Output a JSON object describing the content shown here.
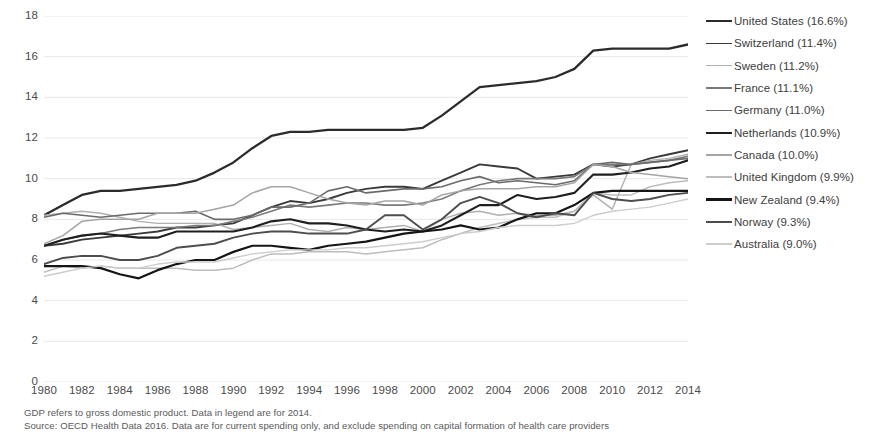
{
  "chart_data": {
    "type": "line",
    "title": "",
    "subtitle": "",
    "xlabel": "",
    "ylabel": "",
    "xlim": [
      1980,
      2014
    ],
    "ylim": [
      0,
      18
    ],
    "ytick_step": 2,
    "grid": "horizontal",
    "legend_position": "right",
    "yticks": [
      "18",
      "16",
      "14",
      "12",
      "10",
      "8",
      "6",
      "4",
      "2",
      "0"
    ],
    "xticks": [
      "1980",
      "1982",
      "1984",
      "1986",
      "1988",
      "1990",
      "1992",
      "1994",
      "1996",
      "1998",
      "2000",
      "2002",
      "2004",
      "2006",
      "2008",
      "2010",
      "2012",
      "2014"
    ],
    "x": [
      1980,
      1981,
      1982,
      1983,
      1984,
      1985,
      1986,
      1987,
      1988,
      1989,
      1990,
      1991,
      1992,
      1993,
      1994,
      1995,
      1996,
      1997,
      1998,
      1999,
      2000,
      2001,
      2002,
      2003,
      2004,
      2005,
      2006,
      2007,
      2008,
      2009,
      2010,
      2011,
      2012,
      2013,
      2014
    ],
    "series": [
      {
        "name": "United States",
        "legend_label": "United States (16.6%)",
        "value_2014": 16.6,
        "color": "#2b2b2b",
        "width": 2.3,
        "values": [
          8.2,
          8.7,
          9.2,
          9.4,
          9.4,
          9.5,
          9.6,
          9.7,
          9.9,
          10.3,
          10.8,
          11.5,
          12.1,
          12.3,
          12.3,
          12.4,
          12.4,
          12.4,
          12.4,
          12.4,
          12.5,
          13.1,
          13.8,
          14.5,
          14.6,
          14.7,
          14.8,
          15.0,
          15.4,
          16.3,
          16.4,
          16.4,
          16.4,
          16.4,
          16.6
        ]
      },
      {
        "name": "Switzerland",
        "legend_label": "Switzerland (11.4%)",
        "value_2014": 11.4,
        "color": "#3a3a3a",
        "width": 1.9,
        "values": [
          6.7,
          6.8,
          7.0,
          7.1,
          7.2,
          7.3,
          7.4,
          7.6,
          7.6,
          7.7,
          7.8,
          8.2,
          8.6,
          8.9,
          8.8,
          9.0,
          9.3,
          9.5,
          9.6,
          9.6,
          9.5,
          9.9,
          10.3,
          10.7,
          10.6,
          10.5,
          10.0,
          10.1,
          10.2,
          10.7,
          10.6,
          10.7,
          11.0,
          11.2,
          11.4
        ]
      },
      {
        "name": "Sweden",
        "legend_label": "Sweden (11.2%)",
        "value_2014": 11.2,
        "color": "#b0b0b0",
        "width": 1.4,
        "values": [
          8.2,
          8.3,
          8.4,
          8.3,
          8.1,
          7.9,
          7.8,
          7.8,
          7.8,
          7.8,
          7.5,
          7.6,
          7.7,
          7.8,
          7.5,
          7.4,
          7.6,
          7.5,
          7.6,
          7.7,
          7.4,
          8.0,
          8.3,
          8.4,
          8.2,
          8.3,
          8.2,
          8.2,
          8.4,
          9.2,
          8.5,
          10.7,
          10.9,
          11.0,
          11.2
        ]
      },
      {
        "name": "France",
        "legend_label": "France (11.1%)",
        "value_2014": 11.1,
        "color": "#7a7a7a",
        "width": 1.6,
        "values": [
          6.7,
          7.0,
          7.2,
          7.3,
          7.5,
          7.6,
          7.6,
          7.6,
          7.7,
          7.7,
          7.9,
          8.1,
          8.4,
          8.7,
          8.6,
          8.7,
          8.8,
          8.8,
          8.7,
          8.7,
          8.8,
          9.0,
          9.4,
          9.7,
          9.9,
          10.0,
          10.0,
          10.0,
          10.1,
          10.7,
          10.7,
          10.7,
          10.8,
          10.9,
          11.1
        ]
      },
      {
        "name": "Germany",
        "legend_label": "Germany (11.0%)",
        "value_2014": 11.0,
        "color": "#6b6b6b",
        "width": 1.6,
        "values": [
          8.1,
          8.3,
          8.2,
          8.1,
          8.2,
          8.3,
          8.3,
          8.3,
          8.4,
          8.0,
          8.0,
          8.2,
          8.6,
          8.6,
          8.8,
          9.4,
          9.6,
          9.3,
          9.4,
          9.5,
          9.5,
          9.6,
          9.9,
          10.1,
          9.8,
          9.9,
          9.8,
          9.7,
          9.9,
          10.7,
          10.8,
          10.7,
          10.8,
          10.9,
          11.0
        ]
      },
      {
        "name": "Netherlands",
        "legend_label": "Netherlands (10.9%)",
        "value_2014": 10.9,
        "color": "#1f1f1f",
        "width": 2.1,
        "values": [
          6.7,
          7.0,
          7.2,
          7.3,
          7.2,
          7.1,
          7.1,
          7.4,
          7.4,
          7.4,
          7.4,
          7.6,
          7.9,
          8.0,
          7.8,
          7.8,
          7.7,
          7.5,
          7.4,
          7.5,
          7.4,
          7.7,
          8.2,
          8.7,
          8.7,
          9.2,
          9.0,
          9.1,
          9.3,
          10.2,
          10.2,
          10.3,
          10.5,
          10.6,
          10.9
        ]
      },
      {
        "name": "Canada",
        "legend_label": "Canada (10.0%)",
        "value_2014": 10.0,
        "color": "#a5a5a5",
        "width": 1.5,
        "values": [
          6.8,
          7.2,
          7.9,
          8.0,
          8.0,
          8.0,
          8.3,
          8.3,
          8.3,
          8.5,
          8.7,
          9.3,
          9.6,
          9.6,
          9.3,
          9.0,
          8.8,
          8.7,
          8.9,
          8.9,
          8.7,
          9.2,
          9.4,
          9.5,
          9.5,
          9.5,
          9.6,
          9.6,
          9.8,
          10.7,
          10.6,
          10.3,
          10.2,
          10.1,
          10.0
        ]
      },
      {
        "name": "United Kingdom",
        "legend_label": "United Kingdom (9.9%)",
        "value_2014": 9.9,
        "color": "#bdbdbd",
        "width": 1.5,
        "values": [
          5.4,
          5.7,
          5.6,
          5.7,
          5.6,
          5.6,
          5.6,
          5.6,
          5.5,
          5.5,
          5.6,
          6.0,
          6.3,
          6.3,
          6.4,
          6.4,
          6.4,
          6.3,
          6.4,
          6.5,
          6.6,
          7.0,
          7.3,
          7.6,
          7.8,
          8.0,
          8.1,
          8.1,
          8.4,
          9.3,
          9.2,
          9.2,
          9.6,
          9.8,
          9.9
        ]
      },
      {
        "name": "New Zealand",
        "legend_label": "New Zealand (9.4%)",
        "value_2014": 9.4,
        "color": "#151515",
        "width": 2.2,
        "values": [
          5.7,
          5.7,
          5.7,
          5.6,
          5.3,
          5.1,
          5.5,
          5.8,
          6.0,
          6.0,
          6.4,
          6.7,
          6.7,
          6.6,
          6.5,
          6.7,
          6.8,
          6.9,
          7.1,
          7.3,
          7.4,
          7.5,
          7.7,
          7.5,
          7.6,
          8.0,
          8.3,
          8.3,
          8.7,
          9.3,
          9.4,
          9.4,
          9.4,
          9.4,
          9.4
        ]
      },
      {
        "name": "Norway",
        "legend_label": "Norway (9.3%)",
        "value_2014": 9.3,
        "color": "#4d4d4d",
        "width": 1.9,
        "values": [
          5.8,
          6.1,
          6.2,
          6.2,
          6.0,
          6.0,
          6.2,
          6.6,
          6.7,
          6.8,
          7.1,
          7.3,
          7.4,
          7.4,
          7.3,
          7.3,
          7.3,
          7.5,
          8.2,
          8.2,
          7.5,
          8.0,
          8.8,
          9.1,
          8.8,
          8.3,
          8.1,
          8.3,
          8.2,
          9.3,
          9.0,
          8.9,
          9.0,
          9.2,
          9.3
        ]
      },
      {
        "name": "Australia",
        "legend_label": "Australia (9.0%)",
        "value_2014": 9.0,
        "color": "#cdcdcd",
        "width": 1.4,
        "values": [
          5.2,
          5.4,
          5.6,
          5.7,
          5.6,
          5.6,
          5.8,
          5.9,
          5.9,
          5.9,
          6.1,
          6.3,
          6.4,
          6.5,
          6.5,
          6.5,
          6.6,
          6.6,
          6.7,
          6.8,
          6.9,
          7.1,
          7.3,
          7.4,
          7.6,
          7.7,
          7.7,
          7.7,
          7.8,
          8.2,
          8.4,
          8.5,
          8.6,
          8.8,
          9.0
        ]
      }
    ]
  },
  "legend": {
    "items": [
      {
        "label": "United States (16.6%)"
      },
      {
        "label": "Switzerland (11.4%)"
      },
      {
        "label": "Sweden (11.2%)"
      },
      {
        "label": "France (11.1%)"
      },
      {
        "label": "Germany (11.0%)"
      },
      {
        "label": "Netherlands (10.9%)"
      },
      {
        "label": "Canada (10.0%)"
      },
      {
        "label": "United Kingdom (9.9%)"
      },
      {
        "label": "New Zealand (9.4%)"
      },
      {
        "label": "Norway (9.3%)"
      },
      {
        "label": "Australia (9.0%)"
      }
    ]
  },
  "footnotes": [
    "GDP refers to gross domestic product. Data in legend are for 2014.",
    "Source: OECD Health Data 2016.  Data are for current spending only, and exclude spending on capital formation of health care providers"
  ],
  "style": {
    "grid_color": "#e8e8e8",
    "axis_text_color": "#4a4a4a",
    "background": "#ffffff"
  }
}
